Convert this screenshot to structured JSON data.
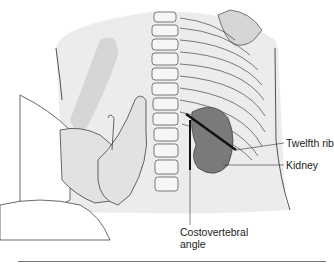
{
  "figure": {
    "labels": {
      "twelfth_rib": "Twelfth rib",
      "kidney": "Kidney",
      "cva_line1": "Costovertebral",
      "cva_line2": "angle"
    },
    "colors": {
      "background": "#ffffff",
      "body_fill": "#ececec",
      "shadow_fill": "#d6d6d6",
      "kidney_fill": "#7a7a7a",
      "outline": "#2a2a2a",
      "rule": "#777777"
    }
  }
}
